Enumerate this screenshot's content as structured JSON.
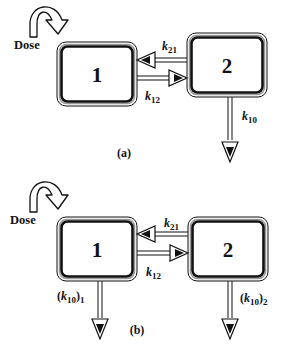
{
  "figure": {
    "panels": [
      {
        "id": "a",
        "caption": "(a)",
        "dose_label": "Dose",
        "compartments": [
          {
            "label": "1"
          },
          {
            "label": "2"
          }
        ],
        "rates": {
          "k21": {
            "main": "k",
            "sub": "21"
          },
          "k12": {
            "main": "k",
            "sub": "12"
          },
          "elim": [
            {
              "from": "2",
              "prefix": "",
              "main": "k",
              "sub": "10",
              "suffix": "",
              "suffix_sub": ""
            }
          ]
        }
      },
      {
        "id": "b",
        "caption": "(b)",
        "dose_label": "Dose",
        "compartments": [
          {
            "label": "1"
          },
          {
            "label": "2"
          }
        ],
        "rates": {
          "k21": {
            "main": "k",
            "sub": "21"
          },
          "k12": {
            "main": "k",
            "sub": "12"
          },
          "elim": [
            {
              "from": "1",
              "prefix": "(",
              "main": "k",
              "sub": "10",
              "suffix": ")",
              "suffix_sub": "1"
            },
            {
              "from": "2",
              "prefix": "(",
              "main": "k",
              "sub": "10",
              "suffix": ")",
              "suffix_sub": "2"
            }
          ]
        }
      }
    ],
    "colors": {
      "ink": "#111111",
      "outline_gray": "#888888",
      "background": "#ffffff"
    }
  }
}
